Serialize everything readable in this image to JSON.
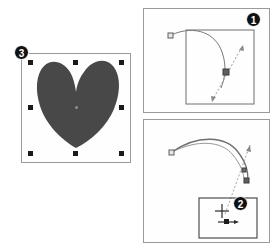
{
  "document": {
    "title": "Shape rotation and reshape steps",
    "background_color": "#ffffff",
    "width": 280,
    "height": 250
  },
  "colors": {
    "shape_fill": "#484848",
    "panel_border": "#9a9a9a",
    "handle": "#1a1a1a",
    "badge_background": "#111111",
    "badge_text": "#ffffff",
    "curve_stroke": "#6b6b6b",
    "dashed_stroke": "#9e9e9e",
    "node_fill": "#6e6e6e"
  },
  "panels": [
    {
      "id": "shape-panel",
      "name": "selected-shape-panel",
      "badge": "3",
      "badge_label": "3",
      "description": "Heart shape selected with eight resize handles",
      "shape": {
        "name": "heart",
        "fill": "#484848",
        "handles_count": 8,
        "has_center_marker": true
      }
    },
    {
      "id": "step1-panel",
      "name": "rotation-handle-panel",
      "badge": "1",
      "badge_label": "1",
      "description": "Arc curve with control node and dashed double arrow across inner rectangle",
      "elements": {
        "curve_node_label": "control-node",
        "arrow_type": "double-headed-dashed",
        "midpoint_marker": "square"
      }
    },
    {
      "id": "step2-panel",
      "name": "reshape-cursor-panel",
      "badge": "2",
      "badge_label": "2",
      "description": "Two arc curves with dashed arrow and reshape crosshair cursor in callout box",
      "elements": {
        "curve_count": 2,
        "cursor_icon": "reshape-crosshair-cursor",
        "arrow_type": "dashed-arrow"
      }
    }
  ],
  "badges": {
    "one": "1",
    "two": "2",
    "three": "3"
  }
}
